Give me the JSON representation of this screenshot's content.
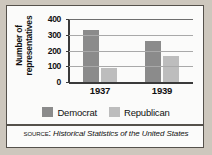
{
  "chart_data": {
    "type": "bar",
    "title": "",
    "xlabel": "",
    "ylabel": "Number of representatives",
    "categories": [
      "1937",
      "1939"
    ],
    "series": [
      {
        "name": "Democrat",
        "color": "#8b8b8b",
        "values": [
          330,
          262
        ]
      },
      {
        "name": "Republican",
        "color": "#bdbdbd",
        "values": [
          88,
          165
        ]
      }
    ],
    "ylim": [
      0,
      400
    ],
    "yticks": [
      0,
      100,
      200,
      300,
      400
    ],
    "ytick_labels": [
      "0",
      "100",
      "200",
      "300",
      "400"
    ],
    "grid": true,
    "legend_position": "bottom"
  },
  "axis": {
    "y_title_line1": "Number of",
    "y_title_line2": "representatives"
  },
  "legend": {
    "items": [
      {
        "label": "Democrat",
        "swatch": "legend-swatch-democrat"
      },
      {
        "label": "Republican",
        "swatch": "legend-swatch-republican"
      }
    ]
  },
  "source": {
    "prefix": "Source:",
    "title": "Historical Statistics of the United States"
  }
}
